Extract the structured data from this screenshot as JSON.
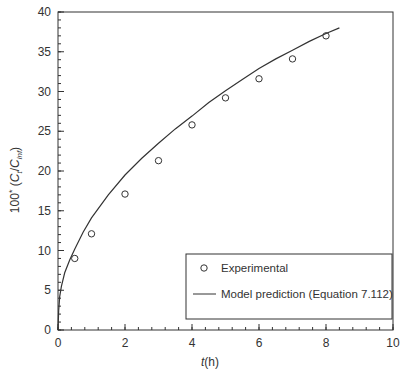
{
  "chart_data": {
    "type": "scatter",
    "title": "",
    "xlabel": "t(h)",
    "xlabel_parts": {
      "italic": "t",
      "normal": "(h)"
    },
    "ylabel": "100*(Ct/Cinf)",
    "ylabel_parts": {
      "prefix": "100",
      "sup": "*",
      "open": " (",
      "c1": "C",
      "sub1": "t",
      "slash": "/",
      "c2": "C",
      "sub2": "inf",
      "close": ")"
    },
    "xlim": [
      0,
      10
    ],
    "ylim": [
      0,
      40
    ],
    "xticks": [
      0,
      2,
      4,
      6,
      8,
      10
    ],
    "yticks": [
      0,
      5,
      10,
      15,
      20,
      25,
      30,
      35,
      40
    ],
    "x_minor_step": 0.4,
    "y_minor_step": 1,
    "grid": false,
    "legend_position": "lower right",
    "series": [
      {
        "name": "Experimental",
        "kind": "scatter",
        "marker": "open-circle",
        "x": [
          0.5,
          1,
          2,
          3,
          4,
          5,
          6,
          7,
          8
        ],
        "y": [
          9.0,
          12.1,
          17.1,
          21.3,
          25.8,
          29.2,
          31.6,
          34.1,
          37.0
        ]
      },
      {
        "name": "Model prediction (Equation 7.112)",
        "kind": "line",
        "x": [
          0,
          0.02,
          0.05,
          0.1,
          0.2,
          0.35,
          0.5,
          0.75,
          1,
          1.5,
          2,
          2.5,
          3,
          3.5,
          4,
          4.5,
          5,
          5.5,
          6,
          6.5,
          7,
          7.5,
          8,
          8.4
        ],
        "y": [
          0,
          2.5,
          4.2,
          5.5,
          7.2,
          8.8,
          10.2,
          12.3,
          14.1,
          17.0,
          19.5,
          21.6,
          23.5,
          25.3,
          26.9,
          28.6,
          30.1,
          31.5,
          32.9,
          34.1,
          35.2,
          36.3,
          37.3,
          38.0
        ]
      }
    ],
    "legend": [
      {
        "label": "Experimental",
        "symbol": "open-circle"
      },
      {
        "label": "Model prediction (Equation 7.112)",
        "symbol": "line"
      }
    ],
    "colors": {
      "axis": "#333333",
      "series": "#333333",
      "background": "#ffffff"
    }
  }
}
